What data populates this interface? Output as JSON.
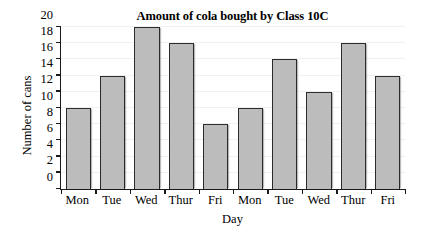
{
  "chart_data": {
    "type": "bar",
    "title": "Amount of cola bought by Class 10C",
    "xlabel": "Day",
    "ylabel": "Number of cans",
    "categories": [
      "Mon",
      "Tue",
      "Wed",
      "Thur",
      "Fri",
      "Mon",
      "Tue",
      "Wed",
      "Thur",
      "Fri"
    ],
    "values": [
      10,
      14,
      20,
      18,
      8,
      10,
      16,
      12,
      18,
      14
    ],
    "ylim": [
      0,
      20
    ],
    "ytick_values": [
      0,
      2,
      4,
      6,
      8,
      10,
      12,
      14,
      16,
      18,
      20
    ],
    "ytick_labels": [
      "0",
      "2",
      "4",
      "6",
      "8",
      "10",
      "12",
      "14",
      "16",
      "18",
      "20"
    ],
    "ytick_step": 2,
    "grid": true,
    "legend": null,
    "bar_fill_color": "#bcbcbc",
    "bar_edge_color": "#2b2b2b",
    "background_color": "#ffffff"
  }
}
